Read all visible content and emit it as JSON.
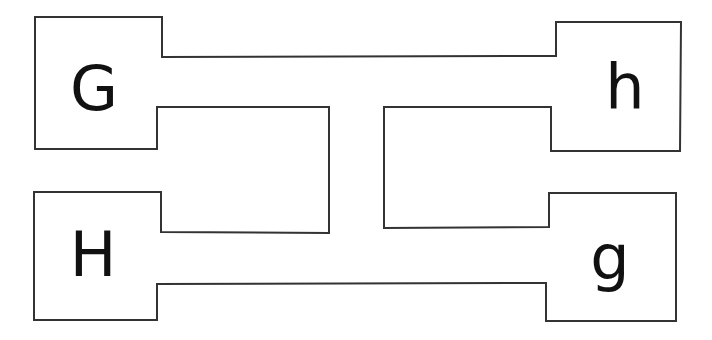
{
  "diagram": {
    "stroke_color": "#333333",
    "background": "#ffffff",
    "nodes": [
      {
        "id": "G",
        "label": "G",
        "position": "top-left"
      },
      {
        "id": "h",
        "label": "h",
        "position": "top-right"
      },
      {
        "id": "H",
        "label": "H",
        "position": "bottom-left"
      },
      {
        "id": "g",
        "label": "g",
        "position": "bottom-right"
      }
    ],
    "connections": [
      {
        "from": "G",
        "to": "h",
        "type": "top-channel"
      },
      {
        "from": "H",
        "to": "g",
        "type": "bottom-channel"
      },
      {
        "from": "G",
        "to": "H",
        "type": "left-loop"
      },
      {
        "from": "h",
        "to": "g",
        "type": "right-loop"
      }
    ]
  }
}
